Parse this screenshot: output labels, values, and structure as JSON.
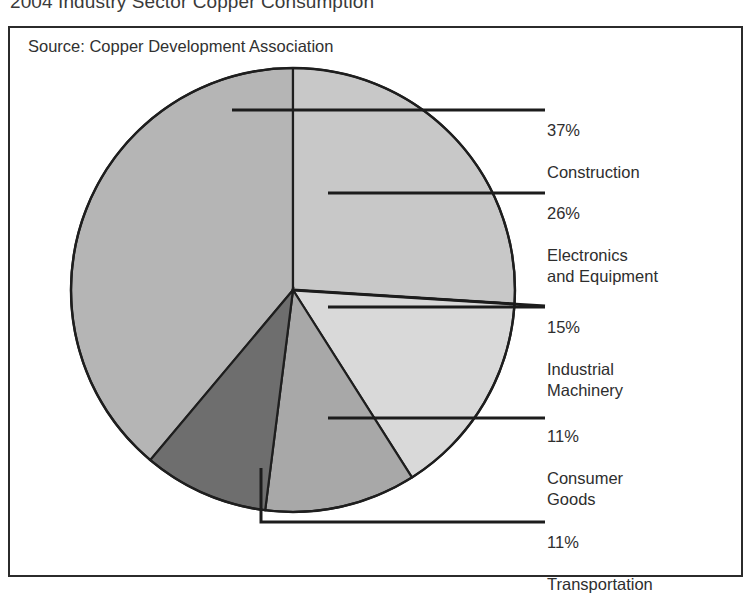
{
  "title": "2004 Industry Sector Copper Consumption",
  "source": "Source: Copper Development Association",
  "colors": {
    "construction": "#b5b5b5",
    "electronics": "#c8c8c8",
    "machinery": "#d9d9d9",
    "consumer": "#a8a8a8",
    "transportation": "#6e6e6e",
    "outline": "#1e1e1e",
    "frame": "#2b2b2b",
    "text": "#2e2e2e",
    "background": "#ffffff"
  },
  "callouts": [
    {
      "pct": "37%",
      "name": "Construction"
    },
    {
      "pct": "26%",
      "name": "Electronics\nand Equipment"
    },
    {
      "pct": "15%",
      "name": "Industrial\nMachinery"
    },
    {
      "pct": "11%",
      "name": "Consumer\nGoods"
    },
    {
      "pct": "11%",
      "name": "Transportation"
    }
  ],
  "chart_data": {
    "type": "pie",
    "title": "2004 Industry Sector Copper Consumption",
    "subtitle": "Source: Copper Development Association",
    "xlabel": "",
    "ylabel": "",
    "legend_position": "callout-labels-right",
    "grid": false,
    "units": "percent",
    "total": 100,
    "start_angle_deg": 0,
    "direction": "clockwise",
    "center": {
      "x": 293,
      "y": 290
    },
    "radius": 222,
    "labels": [
      "Construction",
      "Electronics and Equipment",
      "Industrial Machinery",
      "Consumer Goods",
      "Transportation"
    ],
    "values": [
      37,
      26,
      15,
      11,
      11
    ],
    "slices": [
      {
        "label": "Construction",
        "value": 37,
        "display": "37%",
        "color": "#b5b5b5",
        "start_deg": 220,
        "end_deg": 360
      },
      {
        "label": "Electronics and Equipment",
        "value": 26,
        "display": "26%",
        "color": "#c8c8c8",
        "start_deg": 0,
        "end_deg": 93.6
      },
      {
        "label": "Industrial Machinery",
        "value": 15,
        "display": "15%",
        "color": "#d9d9d9",
        "start_deg": 93.6,
        "end_deg": 147.6
      },
      {
        "label": "Consumer Goods",
        "value": 11,
        "display": "11%",
        "color": "#a8a8a8",
        "start_deg": 147.6,
        "end_deg": 187.2
      },
      {
        "label": "Transportation",
        "value": 11,
        "display": "11%",
        "color": "#6e6e6e",
        "start_deg": 187.2,
        "end_deg": 220
      }
    ]
  }
}
